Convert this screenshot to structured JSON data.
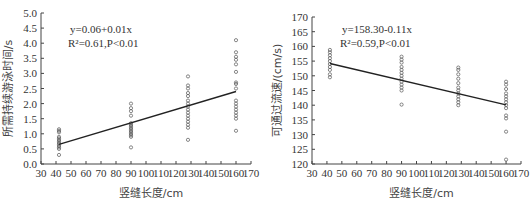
{
  "chart_data": [
    {
      "type": "scatter",
      "title": "",
      "xlabel": "竖缝长度/cm",
      "ylabel": "所需持续游泳时间/s",
      "xlim": [
        30,
        170
      ],
      "ylim": [
        0,
        5
      ],
      "xticks": [
        30,
        40,
        50,
        60,
        70,
        80,
        90,
        100,
        110,
        120,
        130,
        140,
        150,
        160,
        170
      ],
      "yticks": [
        "0.0",
        "0.5",
        "1.0",
        "1.5",
        "2.0",
        "2.5",
        "3.0",
        "3.5",
        "4.0",
        "4.5",
        "5.0"
      ],
      "grid": false,
      "equation": "y=0.06+0.01x",
      "stats": "R²=0.61,P<0.01",
      "fit_line": {
        "x": [
          42,
          160
        ],
        "y": [
          0.65,
          2.4
        ]
      },
      "series": [
        {
          "name": "42 cm",
          "x": 42,
          "values": [
            0.3,
            0.5,
            0.55,
            0.6,
            0.65,
            0.7,
            0.75,
            0.8,
            0.85,
            0.9,
            1.05,
            1.1,
            1.15
          ]
        },
        {
          "name": "90 cm",
          "x": 90,
          "values": [
            0.55,
            0.9,
            0.95,
            1.0,
            1.05,
            1.1,
            1.15,
            1.2,
            1.25,
            1.3,
            1.35,
            1.6,
            1.75,
            1.85,
            2.0
          ]
        },
        {
          "name": "128 cm",
          "x": 128,
          "values": [
            0.8,
            1.2,
            1.3,
            1.4,
            1.5,
            1.6,
            1.7,
            1.8,
            1.9,
            2.0,
            2.1,
            2.25,
            2.35,
            2.5,
            2.6,
            2.9
          ]
        },
        {
          "name": "160 cm",
          "x": 160,
          "values": [
            1.1,
            1.5,
            1.6,
            1.7,
            1.8,
            1.9,
            2.0,
            2.1,
            2.5,
            2.65,
            2.7,
            3.05,
            3.3,
            3.45,
            3.55,
            3.7,
            4.1
          ]
        }
      ]
    },
    {
      "type": "scatter",
      "title": "",
      "xlabel": "竖缝长度/cm",
      "ylabel": "可通过流速/(cm/s)",
      "xlim": [
        30,
        170
      ],
      "ylim": [
        120,
        170
      ],
      "xticks": [
        30,
        40,
        50,
        60,
        70,
        80,
        90,
        100,
        110,
        120,
        130,
        140,
        150,
        160,
        170
      ],
      "yticks": [
        "120",
        "125",
        "130",
        "135",
        "140",
        "145",
        "150",
        "155",
        "160",
        "165",
        "170"
      ],
      "grid": false,
      "equation": "y=158.30-0.11x",
      "stats": "R²=0.59,P<0.01",
      "fit_line": {
        "x": [
          42,
          160
        ],
        "y": [
          154.2,
          140.1
        ]
      },
      "series": [
        {
          "name": "42 cm",
          "x": 42,
          "values": [
            149.5,
            150.5,
            152,
            153,
            154,
            155,
            156,
            157,
            158,
            158.8
          ]
        },
        {
          "name": "90 cm",
          "x": 90,
          "values": [
            140.2,
            145,
            146,
            147,
            148,
            149,
            150,
            151,
            152,
            153,
            154.5,
            155.5,
            156.5
          ]
        },
        {
          "name": "128 cm",
          "x": 128,
          "values": [
            140,
            141,
            142,
            143,
            144,
            145,
            146,
            147.5,
            149,
            150.5,
            152,
            152.8
          ]
        },
        {
          "name": "160 cm",
          "x": 160,
          "values": [
            121.5,
            131,
            135.5,
            136.5,
            139,
            140,
            141,
            142,
            143,
            144,
            145.5,
            147,
            148
          ]
        }
      ]
    }
  ]
}
